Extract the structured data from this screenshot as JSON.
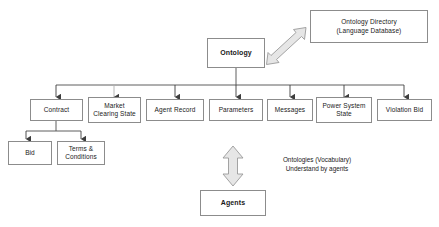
{
  "diagram": {
    "title_text": "",
    "colors": {
      "box_border": "#8c8c8c",
      "box_fill": "#ffffff",
      "connector": "#4d4d4d",
      "block_arrow_fill": "#e6e6e6",
      "block_arrow_stroke": "#999999",
      "text": "#1a1a1a"
    },
    "nodes": {
      "ontology": {
        "label": "Ontology"
      },
      "ontology_directory": {
        "label": "Ontology Directory\n(Language Database)"
      },
      "agents": {
        "label": "Agents"
      },
      "children": [
        {
          "id": "contract",
          "label": "Contract"
        },
        {
          "id": "market-clearing-state",
          "label": "Market\nClearing State"
        },
        {
          "id": "agent-record",
          "label": "Agent Record"
        },
        {
          "id": "parameters",
          "label": "Parameters"
        },
        {
          "id": "messages",
          "label": "Messages"
        },
        {
          "id": "power-system-state",
          "label": "Power System\nState"
        },
        {
          "id": "violation-bid",
          "label": "Violation Bid"
        }
      ],
      "contract_children": [
        {
          "id": "bid",
          "label": "Bid"
        },
        {
          "id": "terms-and-conditions",
          "label": "Terms &\nConditions"
        }
      ]
    },
    "annotations": {
      "agents_note": "Ontologies (Vocabulary)\nUnderstand by agents"
    },
    "connectors": {
      "ontology_to_directory": "double-headed-diagonal-arrow",
      "ontology_to_agents": "double-headed-vertical-block-arrow"
    }
  }
}
